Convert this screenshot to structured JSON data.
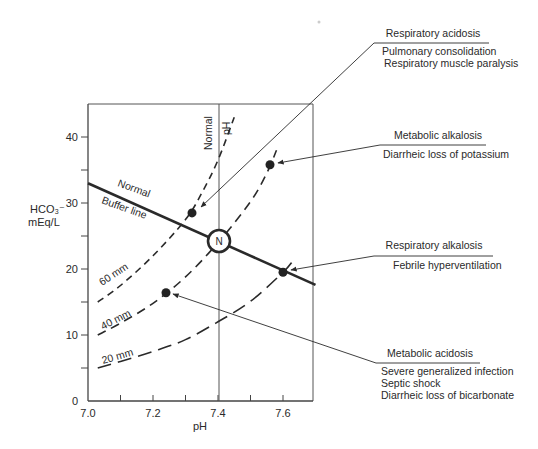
{
  "chart_data": {
    "type": "line",
    "title": "",
    "xlabel": "pH",
    "ylabel": "HCO3⁻ mEq/L",
    "ylabel_lines": [
      "HCO₃⁻",
      "mEq/L"
    ],
    "xlim": [
      7.0,
      7.7
    ],
    "ylim": [
      0,
      44.7
    ],
    "grid": false,
    "x_ticks": [
      7.0,
      7.1,
      7.2,
      7.3,
      7.4,
      7.5,
      7.6
    ],
    "x_tick_labels": [
      "7.0",
      "",
      "7.2",
      "",
      "7.4",
      "",
      "7.6"
    ],
    "y_ticks": [
      0,
      5,
      10,
      15,
      20,
      25,
      30,
      35,
      40
    ],
    "y_tick_labels": [
      "0",
      "",
      "10",
      "",
      "20",
      "",
      "30",
      "",
      "40"
    ],
    "normal_ph_line": {
      "x": 7.4,
      "label": "Normal pH"
    },
    "normal_point": {
      "label": "N",
      "x": 7.4,
      "y": 24
    },
    "buffer_line": {
      "name": "Normal Buffer line",
      "label_lines": [
        "Normal",
        "Buffer line"
      ],
      "x": [
        7.0,
        7.7
      ],
      "y": [
        33.0,
        17.6
      ]
    },
    "series": [
      {
        "name": "60 mm",
        "style": "dashed",
        "x": [
          7.03,
          7.1,
          7.2,
          7.3,
          7.35,
          7.4,
          7.45
        ],
        "y": [
          15.0,
          17.5,
          22.0,
          27.5,
          31.5,
          36.5,
          43.0
        ]
      },
      {
        "name": "40 mm",
        "style": "dashed",
        "x": [
          7.03,
          7.1,
          7.2,
          7.3,
          7.4,
          7.5,
          7.55,
          7.58
        ],
        "y": [
          10.0,
          11.8,
          14.8,
          18.8,
          24.0,
          30.2,
          34.5,
          38.0
        ]
      },
      {
        "name": "20 mm",
        "style": "long-dashed",
        "x": [
          7.03,
          7.1,
          7.2,
          7.3,
          7.4,
          7.5,
          7.6,
          7.63
        ],
        "y": [
          5.0,
          6.0,
          7.5,
          9.3,
          12.0,
          15.1,
          19.5,
          21.2
        ]
      }
    ],
    "points": [
      {
        "name": "Respiratory acidosis",
        "x": 7.32,
        "y": 28.5
      },
      {
        "name": "Metabolic alkalosis",
        "x": 7.56,
        "y": 35.8
      },
      {
        "name": "Respiratory alkalosis",
        "x": 7.6,
        "y": 19.5
      },
      {
        "name": "Metabolic acidosis",
        "x": 7.24,
        "y": 16.4
      }
    ],
    "annotations": [
      {
        "heading": "Respiratory acidosis",
        "lines": [
          "Pulmonary consolidation",
          "Respiratory muscle paralysis"
        ],
        "target": "Respiratory acidosis"
      },
      {
        "heading": "Metabolic alkalosis",
        "lines": [
          "Diarrheic loss of potassium"
        ],
        "target": "Metabolic alkalosis"
      },
      {
        "heading": "Respiratory alkalosis",
        "lines": [
          "Febrile hyperventilation"
        ],
        "target": "Respiratory alkalosis"
      },
      {
        "heading": "Metabolic acidosis",
        "lines": [
          "Severe generalized infection",
          "Septic shock",
          "Diarrheic loss of bicarbonate"
        ],
        "target": "Metabolic acidosis"
      }
    ],
    "colors": {
      "ink": "#2a2a2a",
      "frame": "#555555",
      "background": "#ffffff"
    }
  },
  "labels": {
    "n": "N",
    "normal_ph_1": "Normal",
    "normal_ph_2": "pH",
    "buffer_1": "Normal",
    "buffer_2": "Buffer line",
    "curve_60": "60 mm",
    "curve_40": "40 mm",
    "curve_20": "20 mm",
    "y_title_1": "HCO₃⁻",
    "y_title_2": "mEq/L",
    "x_title": "pH"
  },
  "callouts": {
    "resp_acidosis": {
      "heading": "Respiratory acidosis",
      "l1": "Pulmonary consolidation",
      "l2": "Respiratory muscle paralysis"
    },
    "met_alkalosis": {
      "heading": "Metabolic alkalosis",
      "l1": "Diarrheic loss of potassium"
    },
    "resp_alkalosis": {
      "heading": "Respiratory alkalosis",
      "l1": "Febrile hyperventilation"
    },
    "met_acidosis": {
      "heading": "Metabolic acidosis",
      "l1": "Severe generalized infection",
      "l2": "Septic shock",
      "l3": "Diarrheic loss of bicarbonate"
    }
  }
}
